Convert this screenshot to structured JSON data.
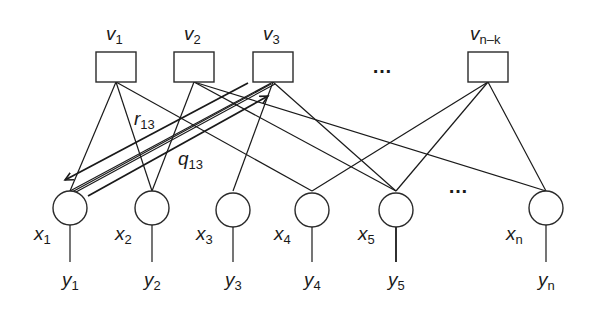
{
  "diagram": {
    "type": "factor graph / Tanner graph with message passing",
    "check_nodes": [
      {
        "id": "v1",
        "label": "v",
        "sub": "1",
        "cx": 116
      },
      {
        "id": "v2",
        "label": "v",
        "sub": "2",
        "cx": 194
      },
      {
        "id": "v3",
        "label": "v",
        "sub": "3",
        "cx": 273
      },
      {
        "id": "vnk",
        "label": "v",
        "sub": "n–k",
        "cx": 488
      }
    ],
    "check_ellipsis": "…",
    "variable_nodes": [
      {
        "id": "x1",
        "label": "x",
        "sub": "1",
        "cx": 70
      },
      {
        "id": "x2",
        "label": "x",
        "sub": "2",
        "cx": 152
      },
      {
        "id": "x3",
        "label": "x",
        "sub": "3",
        "cx": 233
      },
      {
        "id": "x4",
        "label": "x",
        "sub": "4",
        "cx": 312
      },
      {
        "id": "x5",
        "label": "x",
        "sub": "5",
        "cx": 396
      },
      {
        "id": "xn",
        "label": "x",
        "sub": "n",
        "cx": 546
      }
    ],
    "variable_ellipsis": "…",
    "observations": [
      {
        "id": "y1",
        "label": "y",
        "sub": "1"
      },
      {
        "id": "y2",
        "label": "y",
        "sub": "2"
      },
      {
        "id": "y3",
        "label": "y",
        "sub": "3"
      },
      {
        "id": "y4",
        "label": "y",
        "sub": "4"
      },
      {
        "id": "y5",
        "label": "y",
        "sub": "5"
      },
      {
        "id": "yn",
        "label": "y",
        "sub": "n"
      }
    ],
    "edges": [
      [
        "v1",
        "x1"
      ],
      [
        "v1",
        "x2"
      ],
      [
        "v1",
        "x4"
      ],
      [
        "v2",
        "x2"
      ],
      [
        "v2",
        "x5"
      ],
      [
        "v2",
        "xn"
      ],
      [
        "v3",
        "x1"
      ],
      [
        "v3",
        "x3"
      ],
      [
        "v3",
        "x5"
      ],
      [
        "vnk",
        "x4"
      ],
      [
        "vnk",
        "x5"
      ],
      [
        "vnk",
        "xn"
      ]
    ],
    "messages": [
      {
        "label": "r",
        "sub": "13",
        "direction": "v3 → x1"
      },
      {
        "label": "q",
        "sub": "13",
        "direction": "x1 → v3"
      }
    ]
  }
}
